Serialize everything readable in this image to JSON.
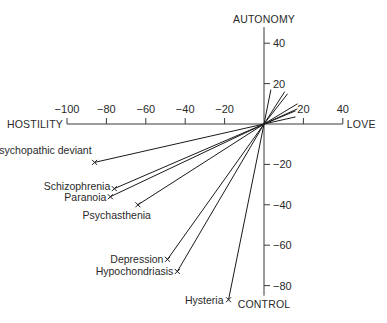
{
  "chart_data": {
    "type": "scatter",
    "subtype": "vector-rays-from-origin",
    "title": "",
    "axes": {
      "x": {
        "negative_label": "HOSTILITY",
        "positive_label": "LOVE",
        "range": [
          -100,
          40
        ],
        "ticks": [
          -100,
          -80,
          -60,
          -40,
          -20,
          20,
          40
        ],
        "tick_labels": [
          "−100",
          "−80",
          "−60",
          "−40",
          "−20",
          "20",
          "40"
        ]
      },
      "y": {
        "positive_label": "AUTONOMY",
        "negative_label": "CONTROL",
        "range": [
          -85,
          48
        ],
        "ticks": [
          40,
          20,
          -20,
          -40,
          -60,
          -80
        ],
        "tick_labels": [
          "40",
          "20",
          "−20",
          "−40",
          "−60",
          "−80"
        ]
      }
    },
    "grid": false,
    "legend": null,
    "labeled_points": [
      {
        "label": "Psychopathic deviant",
        "x": -86,
        "y": -19
      },
      {
        "label": "Schizophrenia",
        "x": -76,
        "y": -32
      },
      {
        "label": "Paranoia",
        "x": -78,
        "y": -36
      },
      {
        "label": "Psychasthenia",
        "x": -64,
        "y": -40
      },
      {
        "label": "Depression",
        "x": -49,
        "y": -67
      },
      {
        "label": "Hypochondriasis",
        "x": -44,
        "y": -73
      },
      {
        "label": "Hysteria",
        "x": -18,
        "y": -87
      }
    ],
    "unlabeled_rays": [
      {
        "x": 3.5,
        "y": 17
      },
      {
        "x": 10.5,
        "y": 16
      },
      {
        "x": 12,
        "y": 15
      },
      {
        "x": 17,
        "y": 10
      },
      {
        "x": 17,
        "y": 7.5
      },
      {
        "x": 16,
        "y": 6.5
      },
      {
        "x": 16,
        "y": 3.5
      }
    ]
  }
}
